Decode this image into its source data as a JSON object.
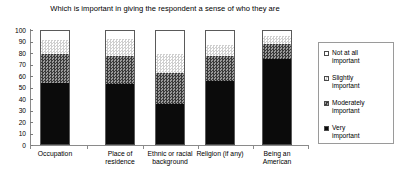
{
  "chart_data": {
    "type": "bar",
    "subtype": "stacked-bar-100",
    "title": "Which is important in giving the respondent a sense of who they are",
    "xlabel": "",
    "ylabel": "",
    "ylim": [
      0,
      100
    ],
    "yticks": [
      0,
      10,
      20,
      30,
      40,
      50,
      60,
      70,
      80,
      90,
      100
    ],
    "ytick_labels": [
      "0",
      "10",
      "20",
      "30",
      "40",
      "50",
      "60",
      "70",
      "80",
      "90",
      "100"
    ],
    "grid": false,
    "legend_position": "right",
    "categories": [
      "Occupation",
      "Place of residence",
      "Ethnic or racial background",
      "Religion (if any)",
      "Being an American"
    ],
    "series": [
      {
        "name": "Very important",
        "values": [
          54,
          53,
          36,
          56,
          75
        ]
      },
      {
        "name": "Moderately important",
        "values": [
          25,
          24,
          27,
          21,
          13
        ]
      },
      {
        "name": "Slightly important",
        "values": [
          12,
          15,
          16,
          10,
          7
        ]
      },
      {
        "name": "Not at all important",
        "values": [
          9,
          8,
          21,
          13,
          5
        ]
      }
    ],
    "stack_order_top_to_bottom": [
      "Not at all important",
      "Slightly important",
      "Moderately important",
      "Very important"
    ]
  },
  "legend": {
    "items": [
      {
        "label_line1": "Not at all",
        "label_line2": "important",
        "swatch": "white-outline"
      },
      {
        "label_line1": "Slightly",
        "label_line2": "important",
        "swatch": "light-dotted"
      },
      {
        "label_line1": "Moderately",
        "label_line2": "important",
        "swatch": "dark-checker"
      },
      {
        "label_line1": "Very",
        "label_line2": "important",
        "swatch": "solid-black"
      }
    ]
  },
  "xlabels": [
    {
      "line1": "Occupation",
      "line2": ""
    },
    {
      "line1": "Place of",
      "line2": "residence"
    },
    {
      "line1": "Ethnic or racial",
      "line2": "background"
    },
    {
      "line1": "Religion (if any)",
      "line2": ""
    },
    {
      "line1": "Being an",
      "line2": "American"
    }
  ],
  "colors": {
    "very_important": "#0b0b0b",
    "moderately_important": "#5d5d5d",
    "slightly_important": "#f2f2f2",
    "not_at_all_important": "#ffffff",
    "axis": "#8a8a8a",
    "text": "#000000"
  }
}
